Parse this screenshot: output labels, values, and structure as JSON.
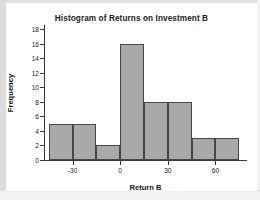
{
  "figure": {
    "title": "Histogram of Returns on Investment B",
    "background_color": "#ffffff",
    "frame_color": "#dcdcdc"
  },
  "axes": {
    "x_label": "Return B",
    "y_label": "Frequency",
    "x_tick_labels": [
      "-30",
      "0",
      "30",
      "60"
    ],
    "y_tick_labels": [
      "0",
      "2",
      "4",
      "6",
      "8",
      "10",
      "12",
      "14",
      "16",
      "18"
    ]
  },
  "chart_data": {
    "type": "bar",
    "title": "Histogram of Returns on Investment B",
    "xlabel": "Return B",
    "ylabel": "Frequency",
    "bar_color": "#a9a9a9",
    "bar_edge_color": "#474747",
    "grid": false,
    "legend": "none",
    "xlim": [
      -48,
      78
    ],
    "ylim": [
      0,
      18.6
    ],
    "x_ticks": [
      -30,
      0,
      30,
      60
    ],
    "y_ticks": [
      0,
      2,
      4,
      6,
      8,
      10,
      12,
      14,
      16,
      18
    ],
    "bin_width": 15,
    "bin_edges": [
      -45,
      -30,
      -15,
      0,
      15,
      30,
      45,
      60,
      75
    ],
    "categories": [
      "-45 to -30",
      "-30 to -15",
      "-15 to 0",
      "0 to 15",
      "15 to 30",
      "30 to 45",
      "45 to 60",
      "60 to 75"
    ],
    "bin_centers": [
      -37.5,
      -22.5,
      -7.5,
      7.5,
      22.5,
      37.5,
      52.5,
      67.5
    ],
    "values": [
      5,
      5,
      2,
      16,
      8,
      8,
      3,
      3
    ]
  }
}
